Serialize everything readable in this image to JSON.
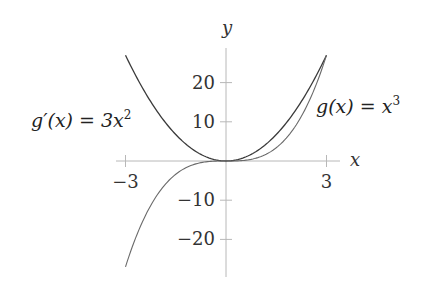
{
  "chart_data": {
    "type": "line",
    "title": "",
    "xlabel": "x",
    "ylabel": "y",
    "xlim": [
      -3,
      3
    ],
    "ylim": [
      -29,
      29
    ],
    "grid": false,
    "x_ticks": [
      -3,
      3
    ],
    "x_tick_labels": [
      "−3",
      "3"
    ],
    "y_ticks": [
      -20,
      -10,
      10,
      20
    ],
    "y_tick_labels": [
      "−20",
      "−10",
      "10",
      "20"
    ],
    "series": [
      {
        "name": "g'(x) = 3x^2",
        "label_text": {
          "base": "g′(x) = 3x",
          "exp": "2"
        },
        "x": [
          -3,
          -2.5,
          -2,
          -1.5,
          -1,
          -0.5,
          0,
          0.5,
          1,
          1.5,
          2,
          2.5,
          3
        ],
        "values": [
          27,
          18.75,
          12,
          6.75,
          3,
          0.75,
          0,
          0.75,
          3,
          6.75,
          12,
          18.75,
          27
        ],
        "color": "#3a3a3a"
      },
      {
        "name": "g(x) = x^3",
        "label_text": {
          "base": "g(x) = x",
          "exp": "3"
        },
        "x": [
          -3,
          -2.5,
          -2,
          -1.5,
          -1,
          -0.5,
          0,
          0.5,
          1,
          1.5,
          2,
          2.5,
          3
        ],
        "values": [
          -27,
          -15.625,
          -8,
          -3.375,
          -1,
          -0.125,
          0,
          0.125,
          1,
          3.375,
          8,
          15.625,
          27
        ],
        "color": "#6a6a6a"
      }
    ],
    "legend": "inline labels: g'(x)=3x^2 left of y-axis near y=11; g(x)=x^3 right near y=11"
  }
}
